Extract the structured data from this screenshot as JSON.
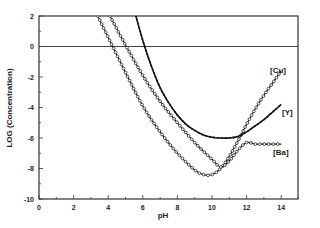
{
  "chart_data": {
    "type": "line",
    "title": "",
    "xlabel": "pH",
    "ylabel": "LOG (Concentration)",
    "xlim": [
      0,
      15
    ],
    "ylim": [
      -10,
      2
    ],
    "xticks": [
      0,
      2,
      4,
      6,
      8,
      10,
      12,
      14
    ],
    "yticks": [
      2,
      0,
      -2,
      -4,
      -6,
      -8,
      -10
    ],
    "grid": false,
    "reference_line": {
      "y": 0
    },
    "legend_position": "inline-right",
    "series": [
      {
        "name": "[Cu]",
        "marker": "circle",
        "x": [
          3.4,
          4,
          5,
          6,
          7,
          8,
          9,
          9.5,
          10,
          10.5,
          11,
          11.5,
          12,
          12.5,
          13,
          13.5,
          14
        ],
        "values": [
          2,
          0.6,
          -1.7,
          -3.9,
          -5.6,
          -7.0,
          -8.1,
          -8.4,
          -8.4,
          -8.0,
          -7.2,
          -6.2,
          -5.1,
          -4.1,
          -3.2,
          -2.4,
          -1.6
        ]
      },
      {
        "name": "[Ba]",
        "marker": "circle",
        "x": [
          4.1,
          5,
          6,
          7,
          8,
          9,
          10,
          10.5,
          11,
          11.5,
          12,
          12.5,
          13,
          13.5,
          14
        ],
        "values": [
          2,
          0.1,
          -1.9,
          -3.6,
          -5.0,
          -6.3,
          -7.4,
          -7.9,
          -7.5,
          -6.8,
          -6.3,
          -6.4,
          -6.4,
          -6.4,
          -6.4
        ]
      },
      {
        "name": "[Y]",
        "marker": "dot",
        "x": [
          5.6,
          6,
          6.5,
          7,
          7.5,
          8,
          8.5,
          9,
          9.5,
          10,
          10.5,
          11,
          11.5,
          12,
          12.5,
          13,
          13.5,
          14
        ],
        "values": [
          2,
          0.4,
          -1.3,
          -2.7,
          -3.7,
          -4.5,
          -5.1,
          -5.5,
          -5.8,
          -5.95,
          -6.0,
          -6.0,
          -5.9,
          -5.6,
          -5.2,
          -4.8,
          -4.3,
          -3.8
        ]
      }
    ]
  },
  "labels": {
    "xlabel": "pH",
    "ylabel": "LOG (Concentration)",
    "series_cu": "[Cu]",
    "series_y": "[Y]",
    "series_ba": "[Ba]"
  }
}
